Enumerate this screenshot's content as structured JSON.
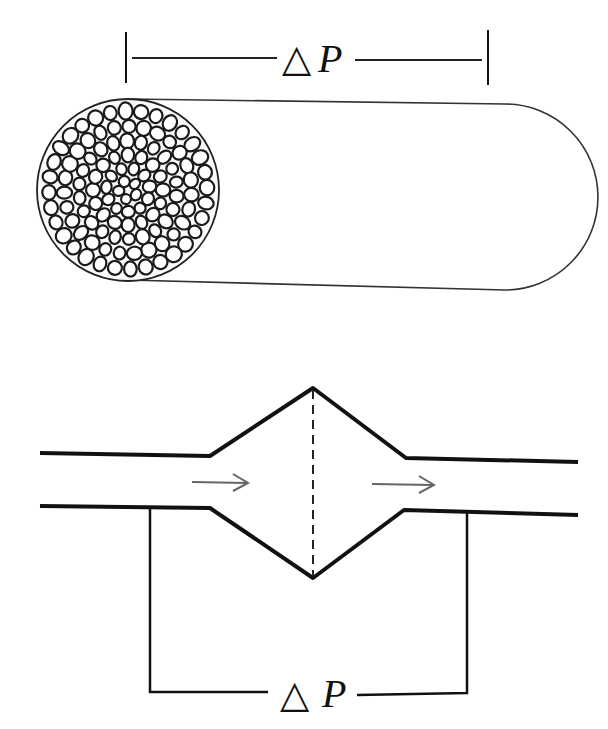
{
  "figure": {
    "top_panel": {
      "description": "Porous packed column (cylinder) filled with granular media",
      "pressure_label": {
        "delta": "△",
        "symbol": "P"
      }
    },
    "bottom_panel": {
      "description": "Pipe with diamond-shaped expansion chamber; flow arrows left to right",
      "pressure_label": {
        "delta": "△",
        "symbol": "P"
      },
      "flow_arrows": [
        "→",
        "→"
      ]
    }
  }
}
